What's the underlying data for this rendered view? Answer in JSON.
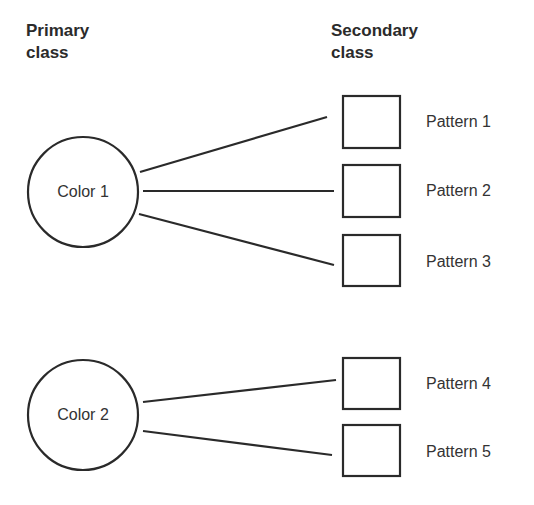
{
  "headings": {
    "primary": [
      "Primary",
      "class"
    ],
    "secondary": [
      "Secondary",
      "class"
    ]
  },
  "primary_nodes": [
    {
      "label": "Color 1",
      "cx": 83,
      "cy": 192,
      "r": 55
    },
    {
      "label": "Color 2",
      "cx": 83,
      "cy": 415,
      "r": 55
    }
  ],
  "secondary_nodes": [
    {
      "label": "Pattern 1",
      "x": 342,
      "y": 95,
      "w": 59,
      "h": 54
    },
    {
      "label": "Pattern 2",
      "x": 342,
      "y": 164,
      "w": 59,
      "h": 54
    },
    {
      "label": "Pattern 3",
      "x": 342,
      "y": 234,
      "w": 59,
      "h": 53
    },
    {
      "label": "Pattern 4",
      "x": 342,
      "y": 357,
      "w": 59,
      "h": 53
    },
    {
      "label": "Pattern 5",
      "x": 342,
      "y": 424,
      "w": 59,
      "h": 53
    }
  ],
  "edges": [
    {
      "from": "Color 1",
      "to": "Pattern 1"
    },
    {
      "from": "Color 1",
      "to": "Pattern 2"
    },
    {
      "from": "Color 1",
      "to": "Pattern 3"
    },
    {
      "from": "Color 2",
      "to": "Pattern 4"
    },
    {
      "from": "Color 2",
      "to": "Pattern 5"
    }
  ],
  "colors": {
    "stroke": "#2a2a2a",
    "background": "#ffffff"
  }
}
